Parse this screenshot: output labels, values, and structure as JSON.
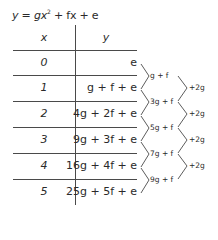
{
  "title": {
    "lhs": "y",
    "eq": " = ",
    "term1": "gx",
    "term1_exp": "2",
    "rest": " + fx + e"
  },
  "table": {
    "headers": [
      "x",
      "y"
    ],
    "rows": [
      {
        "x": "0",
        "y": "e"
      },
      {
        "x": "1",
        "y": "g + f + e"
      },
      {
        "x": "2",
        "y": "4g + 2f + e"
      },
      {
        "x": "3",
        "y": "9g + 3f + e"
      },
      {
        "x": "4",
        "y": "16g + 4f + e"
      },
      {
        "x": "5",
        "y": "25g + 5f + e"
      }
    ]
  },
  "first_differences": [
    "g + f",
    "3g + f",
    "5g + f",
    "7g + f",
    "9g + f"
  ],
  "second_differences": [
    "+2g",
    "+2g",
    "+2g",
    "+2g"
  ],
  "colors": {
    "text": "#2a2a2a",
    "lines": "#4a4a4a"
  }
}
